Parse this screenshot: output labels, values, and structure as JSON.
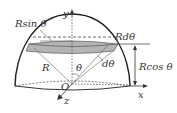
{
  "diagram": {
    "labels": {
      "r_sin_theta": "Rsin θ",
      "r_dtheta": "Rdθ",
      "r_cos_theta": "Rcos θ",
      "radius": "R",
      "theta": "θ",
      "dtheta": "dθ",
      "origin": "O",
      "x_axis": "x",
      "y_axis": "y",
      "z_axis": "z"
    },
    "colors": {
      "stroke": "#333333",
      "band_fill": "#b4b4b4",
      "background": "#ffffff"
    }
  }
}
